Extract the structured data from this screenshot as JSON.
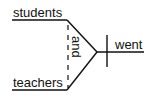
{
  "diagram": {
    "type": "sentence-diagram",
    "subject": {
      "words": [
        "students",
        "teachers"
      ],
      "conjunction": "and"
    },
    "predicate": {
      "verb": "went"
    },
    "colors": {
      "line": "#111111",
      "text": "#111111",
      "background": "#ffffff"
    }
  }
}
